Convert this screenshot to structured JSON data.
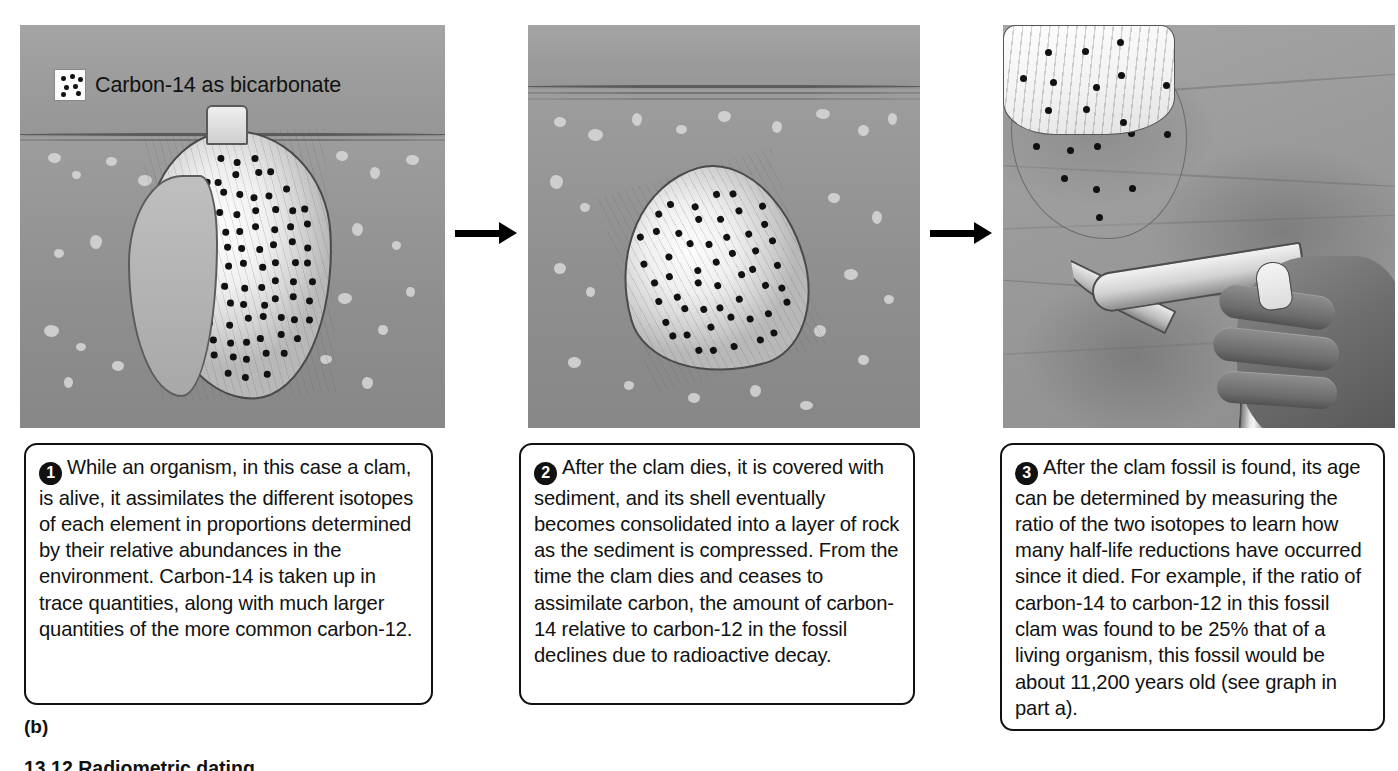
{
  "legend": {
    "icon": "carbon14-dots-swatch",
    "label": "Carbon-14 as bicarbonate",
    "dot_count": 7
  },
  "panels": [
    {
      "id": "panel-1",
      "scene": "living-clam-in-seafloor-sediment",
      "dot_density": "dense",
      "description": "A living clam sits upright partly buried in seafloor sediment with its siphon at the surface; the shell is densely covered with carbon-14 dots."
    },
    {
      "id": "panel-2",
      "scene": "dead-clam-buried-in-sediment",
      "dot_density": "moderate",
      "description": "The dead clam lies tilted, fully buried beneath a layer of sediment; fewer carbon-14 dots remain on the shell."
    },
    {
      "id": "panel-3",
      "scene": "fossil-clam-excavated-with-rock-hammer",
      "dot_density": "sparse",
      "description": "A hand holding a rock hammer chips the fossil clam out of layered rock; only a few carbon-14 dots remain."
    }
  ],
  "captions": [
    {
      "number": "1",
      "text": "While an organism, in this case a clam, is alive, it assimilates the different isotopes of each element in proportions determined by their relative abundances in the environment. Carbon-14 is taken up in trace quantities, along with much larger quantities of the more common carbon-12."
    },
    {
      "number": "2",
      "text": "After the clam dies, it is covered with sediment, and its shell eventually becomes consolidated into a layer of rock as the sediment is compressed. From the time the clam dies and ceases to assimilate carbon, the amount of carbon-14 relative to carbon-12 in the fossil declines due to radioactive decay."
    },
    {
      "number": "3",
      "text": "After the clam fossil is found, its age can be determined by measuring the ratio of the two isotopes to learn how many half-life reductions have occurred since it died. For example, if the ratio of carbon-14 to carbon-12 in this fossil clam was found to be 25% that of a living organism, this fossil would be about 11,200 years old (see graph in part a)."
    }
  ],
  "part_label": "(b)",
  "figure_caption": "13.12  Radiometric dating",
  "colors": {
    "ink": "#111111",
    "sediment": "#9a9a9a",
    "shell": "#f2f2f2",
    "box_border": "#111111"
  }
}
